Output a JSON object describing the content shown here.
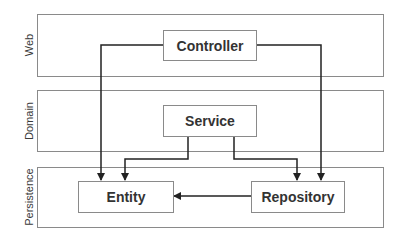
{
  "diagram": {
    "type": "layered-architecture",
    "layers": [
      {
        "id": "web",
        "label": "Web"
      },
      {
        "id": "domain",
        "label": "Domain"
      },
      {
        "id": "persistence",
        "label": "Persistence"
      }
    ],
    "nodes": {
      "controller": {
        "label": "Controller",
        "layer": "web"
      },
      "service": {
        "label": "Service",
        "layer": "domain"
      },
      "entity": {
        "label": "Entity",
        "layer": "persistence"
      },
      "repository": {
        "label": "Repository",
        "layer": "persistence"
      }
    },
    "edges": [
      {
        "from": "controller",
        "to": "entity"
      },
      {
        "from": "controller",
        "to": "repository"
      },
      {
        "from": "service",
        "to": "entity"
      },
      {
        "from": "service",
        "to": "repository"
      },
      {
        "from": "repository",
        "to": "entity"
      }
    ],
    "colors": {
      "border": "#8a8a8a",
      "wire": "#222222",
      "text": "#333333"
    }
  }
}
